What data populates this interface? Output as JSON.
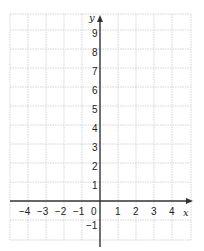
{
  "diagram": {
    "type": "coordinate-grid",
    "x_axis": {
      "label": "x",
      "min": -5,
      "max": 5,
      "tick_labels": [
        "−4",
        "−3",
        "−2",
        "−1",
        "0",
        "1",
        "2",
        "3",
        "4"
      ]
    },
    "y_axis": {
      "label": "y",
      "min": -2,
      "max": 10,
      "tick_labels": [
        "9",
        "8",
        "7",
        "6",
        "5",
        "4",
        "3",
        "2",
        "1",
        "−1"
      ]
    },
    "grid": true,
    "colors": {
      "grid": "#d4d4d4",
      "axis": "#333333",
      "text": "#222222"
    }
  }
}
